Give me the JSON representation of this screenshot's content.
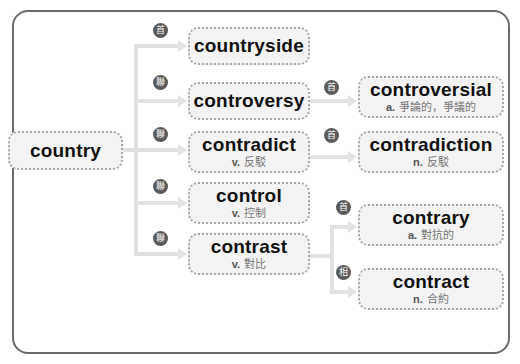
{
  "diagram": {
    "root": {
      "word": "country"
    },
    "level1": [
      {
        "badge": "首",
        "word": "countryside",
        "pos": "",
        "meaning": ""
      },
      {
        "badge": "聯",
        "word": "controversy",
        "pos": "",
        "meaning": ""
      },
      {
        "badge": "聯",
        "word": "contradict",
        "pos": "v.",
        "meaning": "反駁"
      },
      {
        "badge": "聯",
        "word": "control",
        "pos": "v.",
        "meaning": "控制"
      },
      {
        "badge": "聯",
        "word": "contrast",
        "pos": "v.",
        "meaning": "對比"
      }
    ],
    "level2": [
      {
        "from": "controversy",
        "badge": "首",
        "word": "controversial",
        "pos": "a.",
        "meaning": "爭論的，爭議的"
      },
      {
        "from": "contradict",
        "badge": "首",
        "word": "contradiction",
        "pos": "n.",
        "meaning": "反駁"
      },
      {
        "from": "contrast",
        "badge": "首",
        "word": "contrary",
        "pos": "a.",
        "meaning": "對抗的"
      },
      {
        "from": "contrast",
        "badge": "相",
        "word": "contract",
        "pos": "n.",
        "meaning": "合約"
      }
    ],
    "colors": {
      "frame": "#6a6a6a",
      "node_bg": "#f3f3f3",
      "node_border": "#a8a8a8",
      "badge": "#5a5a5a",
      "connector": "#e2e2e2"
    }
  }
}
